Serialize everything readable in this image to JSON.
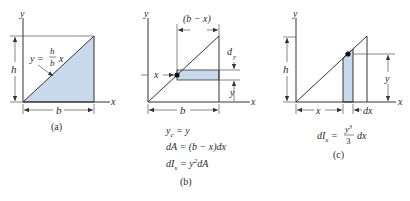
{
  "colors": {
    "shade": "#c7d9ec",
    "line": "#333333",
    "background": "#ffffff"
  },
  "panel_a": {
    "caption": "(a)",
    "axis_x": "x",
    "axis_y": "y",
    "height_label": "h",
    "base_label": "b",
    "curve_label_lhs": "y =",
    "curve_label_num": "h",
    "curve_label_den": "b",
    "curve_label_var": "x"
  },
  "panel_b": {
    "caption": "(b)",
    "axis_x": "x",
    "axis_y": "y",
    "strip_width_label": "(b − x)",
    "strip_height_label": "d",
    "strip_height_sub": "y",
    "offset_label": "y",
    "x_label": "x",
    "base_label": "b",
    "equations": [
      {
        "lhs": "y",
        "sub": "c",
        "rhs": " = y"
      },
      {
        "text": "dA = (b − x)dx"
      },
      {
        "lhs": "dI",
        "sub": "x",
        "rhs": " = y",
        "sup": "2",
        "tail": "dA"
      }
    ]
  },
  "panel_c": {
    "caption": "(c)",
    "axis_x": "x",
    "axis_y": "y",
    "height_label": "h",
    "x_label": "x",
    "dx_label": "dx",
    "y_label": "y",
    "equation": {
      "lhs": "dI",
      "sub": "x",
      "eq": " =",
      "num": "y",
      "num_sup": "3",
      "den": "3",
      "tail": "dx"
    }
  }
}
